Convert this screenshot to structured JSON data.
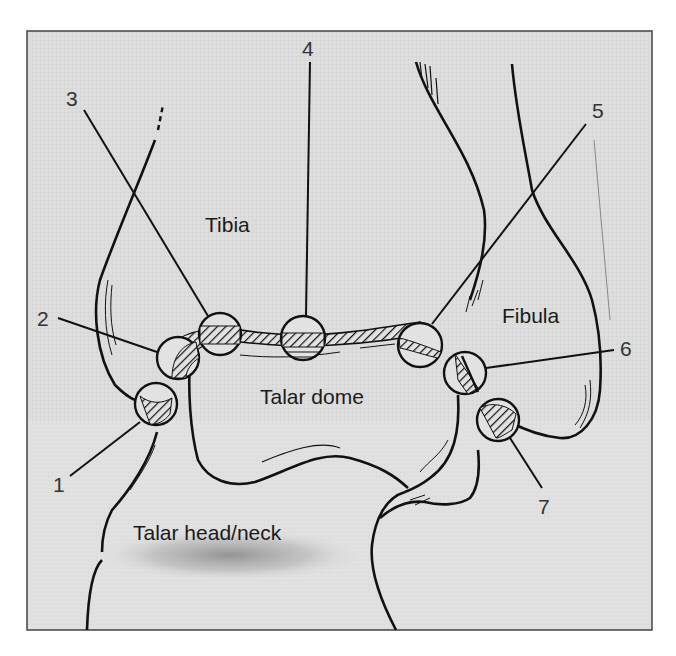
{
  "figure": {
    "type": "anatomical line drawing",
    "frame_color": "#444444",
    "background_color": "#d9d9d9",
    "line_color": "#111111"
  },
  "regions": {
    "tibia": "Tibia",
    "fibula": "Fibula",
    "talar_dome": "Talar dome",
    "talar_head_neck": "Talar head/neck"
  },
  "callouts": [
    {
      "number": "1",
      "label_x": 58,
      "label_y": 478
    },
    {
      "number": "2",
      "label_x": 36,
      "label_y": 308
    },
    {
      "number": "3",
      "label_x": 66,
      "label_y": 88
    },
    {
      "number": "4",
      "label_x": 300,
      "label_y": 36
    },
    {
      "number": "5",
      "label_x": 592,
      "label_y": 98
    },
    {
      "number": "6",
      "label_x": 620,
      "label_y": 337
    },
    {
      "number": "7",
      "label_x": 539,
      "label_y": 495
    }
  ]
}
